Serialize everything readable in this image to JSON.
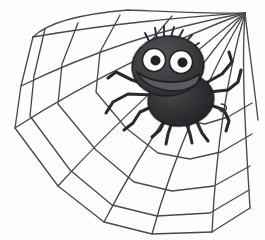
{
  "illustration": {
    "title": "Cartoon spider on a web",
    "description": "A hand-drawn black-and-white sketch of a smiling cartoon spider with two large eyes sitting on a spider web whose radial threads converge at the top-right corner.",
    "medium": "pen-and-ink line drawing with grey wash",
    "canvas": {
      "width": 265,
      "height": 240,
      "background_color": "#fdfdfc"
    },
    "palette": {
      "ink": "#3a3a3c",
      "web_line": "#4a4a4e",
      "body_fill": "#2d2d30",
      "head_fill": "#3c3c3f",
      "mouth_fill": "#55555a",
      "eye_white": "#fbfbf9",
      "pupil": "#222225",
      "paper": "#fdfdfc"
    }
  },
  "web": {
    "name": "spider-web",
    "hub": {
      "x": 245,
      "y": 13
    },
    "radial_count": 9,
    "arc_count": 5,
    "outline_points": "32,36 46,18 128,10 197,22 245,13",
    "radials": [
      {
        "name": "radial-1",
        "to_x": 32,
        "to_y": 38
      },
      {
        "name": "radial-2",
        "to_x": 20,
        "to_y": 86
      },
      {
        "name": "radial-3",
        "to_x": 14,
        "to_y": 128
      },
      {
        "name": "radial-4",
        "to_x": 58,
        "to_y": 186
      },
      {
        "name": "radial-5",
        "to_x": 104,
        "to_y": 222
      },
      {
        "name": "radial-6",
        "to_x": 152,
        "to_y": 234
      },
      {
        "name": "radial-7",
        "to_x": 212,
        "to_y": 232
      },
      {
        "name": "radial-8",
        "to_x": 250,
        "to_y": 208
      },
      {
        "name": "radial-9",
        "to_x": 258,
        "to_y": 120
      }
    ],
    "arcs": [
      {
        "name": "arc-1-innermost"
      },
      {
        "name": "arc-2"
      },
      {
        "name": "arc-3"
      },
      {
        "name": "arc-4"
      },
      {
        "name": "arc-5-outermost"
      }
    ]
  },
  "spider": {
    "name": "cartoon-spider",
    "expression": "smiling",
    "head": {
      "center_x": 168,
      "center_y": 66,
      "radius_x": 36,
      "radius_y": 30
    },
    "body": {
      "center_x": 181,
      "center_y": 100,
      "radius_x": 33,
      "radius_y": 26
    },
    "eyes": [
      {
        "name": "eye-left",
        "cx": 154,
        "cy": 60,
        "r": 11,
        "pupil_cx": 155,
        "pupil_cy": 60,
        "pupil_r": 5
      },
      {
        "name": "eye-right",
        "cx": 181,
        "cy": 62,
        "r": 11,
        "pupil_cx": 182,
        "pupil_cy": 62,
        "pupil_r": 5
      }
    ],
    "mouth": {
      "name": "mouth-grin",
      "description": "wide crescent grin across lower head"
    },
    "hair_tufts": 7,
    "leg_count": 8,
    "legs": [
      {
        "name": "leg-left-upper",
        "side": "left"
      },
      {
        "name": "leg-left-mid",
        "side": "left"
      },
      {
        "name": "leg-left-lower",
        "side": "left"
      },
      {
        "name": "leg-left-bottom",
        "side": "left"
      },
      {
        "name": "leg-right-upper",
        "side": "right"
      },
      {
        "name": "leg-right-mid",
        "side": "right"
      },
      {
        "name": "leg-right-lower",
        "side": "right"
      },
      {
        "name": "leg-right-bottom",
        "side": "right"
      }
    ]
  }
}
